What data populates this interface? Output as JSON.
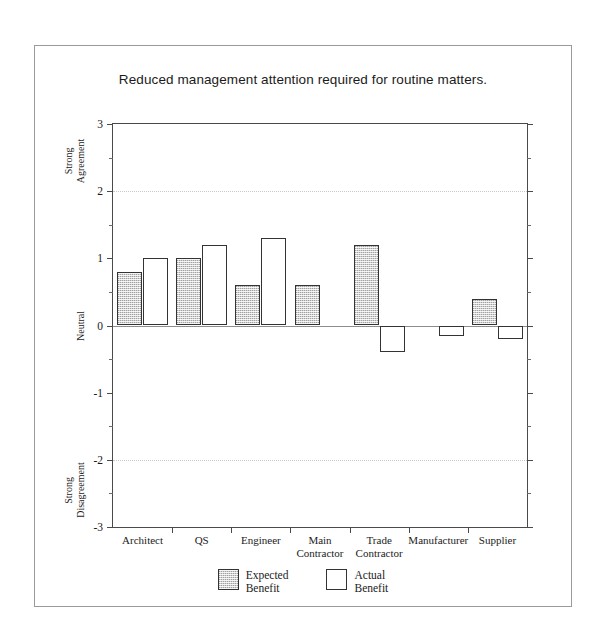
{
  "chart_data": {
    "type": "bar",
    "title": "Reduced management attention required for routine matters.",
    "xlabel": "",
    "ylabel": "",
    "ylim": [
      -3,
      3
    ],
    "grid": "dotted horizontal gridlines at 2 and -2, solid zero line at 0",
    "legend_position": "bottom-center",
    "categories": [
      "Architect",
      "QS",
      "Engineer",
      "Main\nContractor",
      "Trade\nContractor",
      "Manufacturer",
      "Supplier"
    ],
    "series": [
      {
        "name": "Expected\nBenefit",
        "fill": "hatched",
        "values": [
          0.8,
          1.0,
          0.6,
          0.6,
          1.2,
          null,
          0.4
        ]
      },
      {
        "name": "Actual\nBenefit",
        "fill": "white",
        "values": [
          1.0,
          1.2,
          1.3,
          null,
          -0.4,
          -0.15,
          -0.2
        ]
      }
    ],
    "y_ticks": [
      3,
      2,
      1,
      0,
      -1,
      -2,
      -3
    ],
    "y_tick_labels": [
      "3",
      "2",
      "1",
      "0",
      "-1",
      "-2",
      "-3"
    ],
    "y_minor_ticks": [
      2.5,
      1.5,
      0.5,
      -0.5,
      -1.5,
      -2.5
    ],
    "y_axis_anchors": [
      {
        "label": "Strong\nAgreement",
        "value": 2.45
      },
      {
        "label": "Neutral",
        "value": 0
      },
      {
        "label": "Strong\nDisagreement",
        "value": -2.45
      }
    ],
    "colors": {
      "expected_fill": "#d2d2d2",
      "actual_fill": "#ffffff",
      "bar_border": "#333333",
      "axis": "#4a4a4a",
      "gridline": "#c9c9c9",
      "frame": "#9a9a9a",
      "text": "#1b1b1b"
    }
  },
  "legend": {
    "items": [
      {
        "label": "Expected\nBenefit",
        "swatch": "expected"
      },
      {
        "label": "Actual\nBenefit",
        "swatch": "actual"
      }
    ]
  }
}
